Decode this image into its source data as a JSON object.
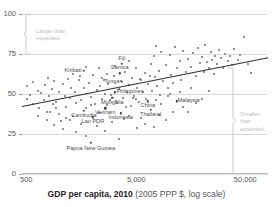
{
  "chart_data": {
    "type": "scatter",
    "title": "",
    "xlabel_bold": "GDP per capita, 2010",
    "xlabel_rest": "(2005 PPP $, log scale)",
    "ylabel": "",
    "xscale": "log",
    "xlim": [
      500,
      100000
    ],
    "ylim": [
      0,
      100
    ],
    "xticks": [
      500,
      5000,
      50000
    ],
    "xtick_labels": [
      "500",
      "5,000",
      "50,000"
    ],
    "yticks": [
      0,
      25,
      50,
      75,
      100
    ],
    "ytick_labels": [
      "0",
      "25",
      "50",
      "75",
      "100"
    ],
    "grid": "horizontal",
    "legend": "none",
    "annotations": [
      {
        "name": "larger-than-expected",
        "text": "Larger than\nexpected",
        "y_range": [
          75,
          100
        ],
        "side": "left"
      },
      {
        "name": "smaller-than-expected",
        "text": "Smaller\nthan\nexpected",
        "y_range": [
          0,
          66
        ],
        "side": "right"
      }
    ],
    "trendline": {
      "x0": 500,
      "y0": 42.5,
      "x1": 100000,
      "y1": 73.0
    },
    "labeled_points": [
      {
        "label": "Kiribati",
        "x": 1900,
        "y": 64.5,
        "lx": -11,
        "ly": 0
      },
      {
        "label": "Fiji",
        "x": 4300,
        "y": 69.0,
        "lx": 0,
        "ly": -5
      },
      {
        "label": "Samoa",
        "x": 4100,
        "y": 63.0,
        "lx": 0,
        "ly": -5
      },
      {
        "label": "Tonga",
        "x": 4300,
        "y": 57.5,
        "lx": -10,
        "ly": 0
      },
      {
        "label": "Philippines",
        "x": 3700,
        "y": 51.0,
        "lx": 15,
        "ly": 0
      },
      {
        "label": "Mongolia",
        "x": 3500,
        "y": 47.5,
        "lx": 0,
        "ly": 5
      },
      {
        "label": "Vietnam",
        "x": 3000,
        "y": 41.0,
        "lx": 0,
        "ly": 5
      },
      {
        "label": "Cambodia",
        "x": 1900,
        "y": 39.5,
        "lx": 0,
        "ly": 5
      },
      {
        "label": "Lao PDR",
        "x": 2300,
        "y": 35.5,
        "lx": 0,
        "ly": 5
      },
      {
        "label": "Indonesia",
        "x": 4200,
        "y": 38.0,
        "lx": 0,
        "ly": 5
      },
      {
        "label": "China",
        "x": 7500,
        "y": 45.5,
        "lx": 0,
        "ly": 5
      },
      {
        "label": "Thailand",
        "x": 8000,
        "y": 40.0,
        "lx": 0,
        "ly": 5
      },
      {
        "label": "Malaysia",
        "x": 14000,
        "y": 45.5,
        "lx": 12,
        "ly": 0
      },
      {
        "label": "Papua New Guinea",
        "x": 2200,
        "y": 19.5,
        "lx": 0,
        "ly": 6
      }
    ],
    "points": [
      [
        560,
        47.0
      ],
      [
        600,
        49.5
      ],
      [
        640,
        44.0
      ],
      [
        700,
        52.0
      ],
      [
        720,
        41.0
      ],
      [
        760,
        50.5
      ],
      [
        800,
        46.0
      ],
      [
        820,
        55.5
      ],
      [
        860,
        38.5
      ],
      [
        900,
        48.5
      ],
      [
        950,
        53.0
      ],
      [
        980,
        43.5
      ],
      [
        1000,
        58.0
      ],
      [
        1050,
        45.0
      ],
      [
        1100,
        51.0
      ],
      [
        1150,
        33.0
      ],
      [
        1200,
        56.5
      ],
      [
        1250,
        49.0
      ],
      [
        1300,
        42.0
      ],
      [
        1350,
        59.5
      ],
      [
        1400,
        47.5
      ],
      [
        1450,
        54.0
      ],
      [
        1500,
        36.5
      ],
      [
        1550,
        51.5
      ],
      [
        1600,
        44.5
      ],
      [
        1700,
        58.5
      ],
      [
        1750,
        61.0
      ],
      [
        1800,
        46.5
      ],
      [
        1900,
        53.5
      ],
      [
        2000,
        41.5
      ],
      [
        2100,
        57.0
      ],
      [
        2200,
        48.0
      ],
      [
        2300,
        62.0
      ],
      [
        2400,
        44.0
      ],
      [
        2500,
        52.5
      ],
      [
        2600,
        38.0
      ],
      [
        2700,
        55.0
      ],
      [
        2800,
        47.0
      ],
      [
        2900,
        59.0
      ],
      [
        3000,
        50.0
      ],
      [
        3100,
        43.0
      ],
      [
        3200,
        56.0
      ],
      [
        3400,
        49.5
      ],
      [
        3600,
        61.5
      ],
      [
        3800,
        45.5
      ],
      [
        4000,
        53.0
      ],
      [
        4200,
        58.0
      ],
      [
        4400,
        47.5
      ],
      [
        4600,
        64.0
      ],
      [
        4800,
        51.0
      ],
      [
        5000,
        55.5
      ],
      [
        5200,
        42.5
      ],
      [
        5400,
        60.0
      ],
      [
        5600,
        49.0
      ],
      [
        5800,
        66.5
      ],
      [
        6000,
        54.0
      ],
      [
        6200,
        45.0
      ],
      [
        6500,
        58.5
      ],
      [
        6800,
        51.5
      ],
      [
        7000,
        63.0
      ],
      [
        7200,
        47.0
      ],
      [
        7600,
        56.0
      ],
      [
        8000,
        69.0
      ],
      [
        8200,
        52.0
      ],
      [
        8500,
        73.5
      ],
      [
        8800,
        60.5
      ],
      [
        9000,
        80.0
      ],
      [
        9200,
        55.0
      ],
      [
        9500,
        64.5
      ],
      [
        9800,
        49.5
      ],
      [
        10000,
        76.0
      ],
      [
        10500,
        58.0
      ],
      [
        11000,
        68.0
      ],
      [
        11500,
        53.5
      ],
      [
        12000,
        74.5
      ],
      [
        12500,
        62.0
      ],
      [
        13000,
        57.0
      ],
      [
        13500,
        79.5
      ],
      [
        14000,
        66.0
      ],
      [
        15000,
        70.5
      ],
      [
        15500,
        59.0
      ],
      [
        16000,
        77.0
      ],
      [
        17000,
        63.5
      ],
      [
        18000,
        72.0
      ],
      [
        19000,
        67.0
      ],
      [
        20000,
        75.5
      ],
      [
        21000,
        61.0
      ],
      [
        22000,
        78.5
      ],
      [
        23000,
        69.5
      ],
      [
        24000,
        73.0
      ],
      [
        25000,
        64.0
      ],
      [
        26000,
        80.5
      ],
      [
        27000,
        70.0
      ],
      [
        28000,
        66.5
      ],
      [
        29000,
        76.5
      ],
      [
        30000,
        71.5
      ],
      [
        31000,
        62.5
      ],
      [
        32000,
        74.0
      ],
      [
        33000,
        68.5
      ],
      [
        35000,
        77.5
      ],
      [
        36000,
        72.5
      ],
      [
        38000,
        66.0
      ],
      [
        40000,
        75.0
      ],
      [
        42000,
        70.5
      ],
      [
        44000,
        73.5
      ],
      [
        46000,
        68.0
      ],
      [
        48000,
        78.0
      ],
      [
        52000,
        71.0
      ],
      [
        55000,
        74.5
      ],
      [
        60000,
        85.5
      ],
      [
        65000,
        69.0
      ],
      [
        70000,
        63.0
      ],
      [
        2500,
        30.0
      ],
      [
        3000,
        27.0
      ],
      [
        3500,
        32.5
      ],
      [
        4000,
        22.0
      ],
      [
        4500,
        34.5
      ],
      [
        5000,
        36.0
      ],
      [
        6000,
        28.5
      ],
      [
        6500,
        35.0
      ],
      [
        7000,
        31.0
      ],
      [
        8500,
        29.5
      ],
      [
        9500,
        37.0
      ],
      [
        11000,
        33.5
      ],
      [
        13000,
        39.0
      ],
      [
        16000,
        42.0
      ],
      [
        18000,
        38.5
      ],
      [
        21000,
        44.5
      ],
      [
        24000,
        47.0
      ],
      [
        28000,
        52.0
      ],
      [
        1000,
        30.5
      ],
      [
        1200,
        28.0
      ],
      [
        1400,
        33.5
      ],
      [
        1600,
        26.5
      ],
      [
        1800,
        31.5
      ],
      [
        2000,
        24.0
      ],
      [
        700,
        36.0
      ],
      [
        850,
        34.0
      ],
      [
        920,
        39.0
      ],
      [
        1100,
        37.5
      ],
      [
        1300,
        35.0
      ],
      [
        2200,
        43.0
      ],
      [
        3300,
        46.0
      ],
      [
        3900,
        44.5
      ],
      [
        4700,
        42.0
      ],
      [
        5500,
        47.5
      ],
      [
        12000,
        50.0
      ],
      [
        15000,
        51.0
      ],
      [
        2600,
        66.0
      ],
      [
        3100,
        62.5
      ],
      [
        3700,
        67.5
      ],
      [
        2800,
        60.0
      ],
      [
        2000,
        67.0
      ],
      [
        1500,
        62.5
      ],
      [
        6300,
        59.5
      ],
      [
        7800,
        61.5
      ],
      [
        9000,
        46.0
      ],
      [
        10000,
        44.0
      ],
      [
        11500,
        48.5
      ],
      [
        19000,
        53.5
      ],
      [
        560,
        55.0
      ],
      [
        640,
        57.5
      ],
      [
        880,
        60.0
      ],
      [
        1050,
        41.0
      ],
      [
        5000,
        70.5
      ],
      [
        5800,
        47.0
      ]
    ]
  }
}
